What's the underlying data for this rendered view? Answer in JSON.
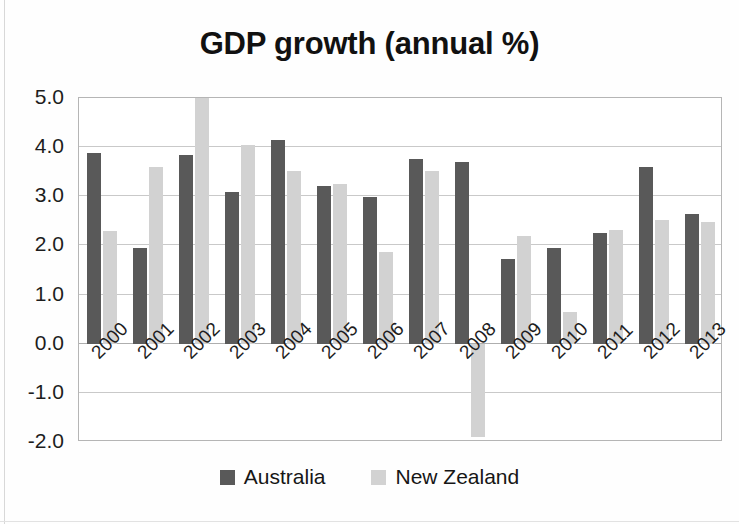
{
  "chart_data": {
    "type": "bar",
    "title": "GDP growth (annual %)",
    "xlabel": "",
    "ylabel": "",
    "categories": [
      "2000",
      "2001",
      "2002",
      "2003",
      "2004",
      "2005",
      "2006",
      "2007",
      "2008",
      "2009",
      "2010",
      "2011",
      "2012",
      "2013"
    ],
    "series": [
      {
        "name": "Australia",
        "color": "#595959",
        "values": [
          3.88,
          1.94,
          3.85,
          3.08,
          4.15,
          3.2,
          2.99,
          3.76,
          3.7,
          1.72,
          1.95,
          2.25,
          3.6,
          2.63
        ]
      },
      {
        "name": "New Zealand",
        "color": "#d2d2d2",
        "values": [
          2.29,
          3.6,
          5.0,
          4.05,
          3.52,
          3.24,
          1.86,
          3.51,
          -1.9,
          2.2,
          0.64,
          2.32,
          2.52,
          2.47
        ]
      }
    ],
    "ylim": [
      -2.0,
      5.0
    ],
    "yticks": [
      "5.0",
      "4.0",
      "3.0",
      "2.0",
      "1.0",
      "0.0",
      "-1.0",
      "-2.0"
    ],
    "ytick_values": [
      5.0,
      4.0,
      3.0,
      2.0,
      1.0,
      0.0,
      -1.0,
      -2.0
    ],
    "grid": true,
    "legend_position": "bottom",
    "axis_label_rotation": -45
  },
  "legend": {
    "items": [
      {
        "label": "Australia",
        "color": "#595959"
      },
      {
        "label": "New Zealand",
        "color": "#d2d2d2"
      }
    ]
  },
  "colors": {
    "australia": "#595959",
    "new_zealand": "#d2d2d2",
    "gridline": "#c9c9c9",
    "axis": "#b5b5b5",
    "text": "#1a1a1a",
    "background": "#ffffff"
  }
}
